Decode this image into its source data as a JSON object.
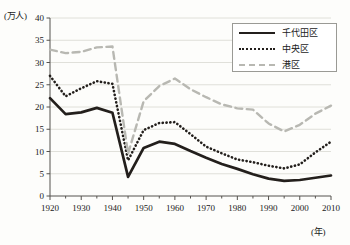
{
  "chart_data": {
    "type": "line",
    "title": "",
    "xlabel": "(年)",
    "ylabel": "(万人)",
    "x": [
      1920,
      1925,
      1930,
      1935,
      1940,
      1945,
      1950,
      1955,
      1960,
      1965,
      1970,
      1975,
      1980,
      1985,
      1990,
      1995,
      2000,
      2005,
      2010
    ],
    "xlim": [
      1920,
      2010
    ],
    "ylim": [
      0,
      40
    ],
    "xticks": [
      1920,
      1930,
      1940,
      1950,
      1960,
      1970,
      1980,
      1990,
      2000,
      2010
    ],
    "xtick_labels": [
      "1920",
      "1930",
      "1940",
      "1950",
      "1960",
      "1970",
      "1980",
      "1990",
      "2000",
      "2010"
    ],
    "yticks": [
      0,
      5,
      10,
      15,
      20,
      25,
      30,
      35,
      40
    ],
    "ytick_labels": [
      "0",
      "5",
      "10",
      "15",
      "20",
      "25",
      "30",
      "35",
      "40"
    ],
    "grid": true,
    "legend_position": "top-right",
    "series": [
      {
        "name": "千代田区",
        "style": "solid",
        "color": "#231f1c",
        "values": [
          22.0,
          18.4,
          18.8,
          19.8,
          18.7,
          4.3,
          10.8,
          12.2,
          11.7,
          10.1,
          8.6,
          7.2,
          6.1,
          4.9,
          3.9,
          3.4,
          3.6,
          4.1,
          4.6
        ]
      },
      {
        "name": "中央区",
        "style": "dotted",
        "color": "#231f1c",
        "values": [
          27.0,
          22.4,
          24.2,
          25.8,
          25.2,
          8.0,
          14.8,
          16.4,
          16.6,
          13.9,
          11.1,
          9.6,
          8.2,
          7.6,
          6.8,
          6.2,
          7.1,
          9.8,
          12.2
        ]
      },
      {
        "name": "港区",
        "style": "dashed",
        "color": "#b8b8b2",
        "values": [
          32.9,
          32.1,
          32.4,
          33.4,
          33.6,
          9.5,
          21.3,
          24.7,
          26.4,
          24.0,
          22.2,
          20.6,
          19.7,
          19.4,
          16.3,
          14.5,
          16.0,
          18.5,
          20.3
        ]
      }
    ]
  },
  "axes": {
    "y_unit_label": "(万人)",
    "x_unit_label": "(年)"
  },
  "legend": {
    "entries": [
      {
        "label": "千代田区",
        "swatch": "solid-line-swatch"
      },
      {
        "label": "中央区",
        "swatch": "dotted-line-swatch"
      },
      {
        "label": "港区",
        "swatch": "dashed-line-swatch"
      }
    ]
  }
}
